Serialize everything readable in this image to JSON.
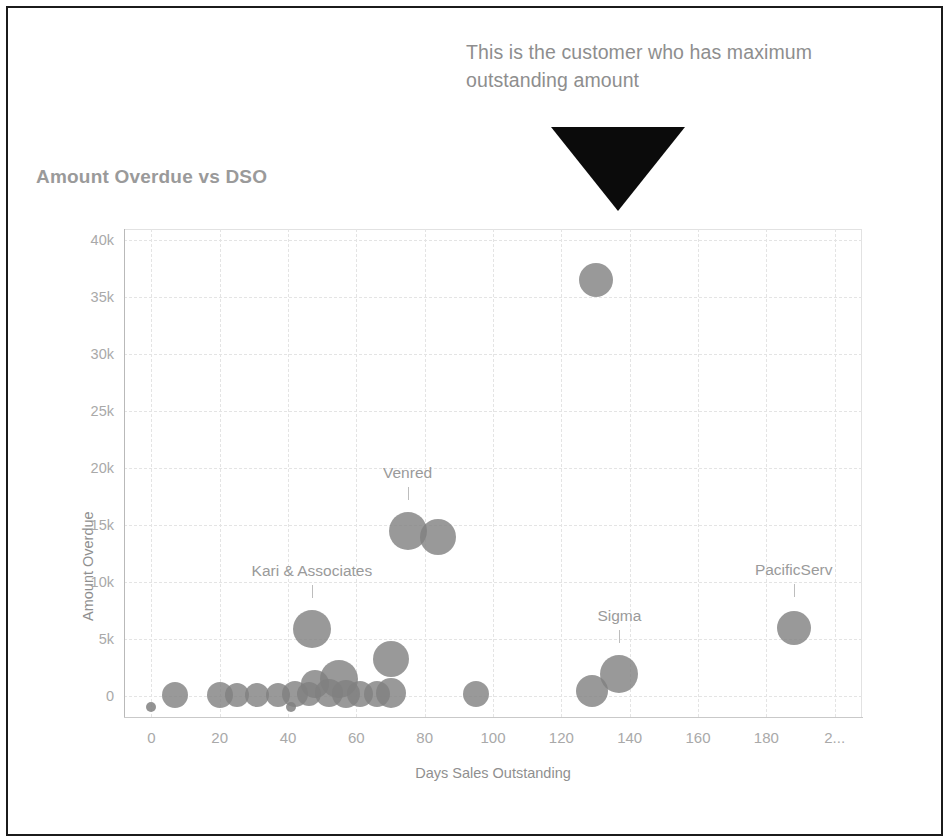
{
  "annotation": {
    "text": "This is the customer who has maximum outstanding amount",
    "arrow_icon": "down-triangle-arrow-icon",
    "color": "#8e8e8e"
  },
  "chart_title": "Amount Overdue vs DSO",
  "chart_data": {
    "type": "scatter",
    "title": "Amount Overdue vs DSO",
    "xlabel": "Days Sales Outstanding",
    "ylabel": "Amount Overdue",
    "xlim": [
      -8,
      208
    ],
    "ylim": [
      -1800,
      41000
    ],
    "grid": true,
    "legend": null,
    "xticks": [
      "0",
      "20",
      "40",
      "60",
      "80",
      "100",
      "120",
      "140",
      "160",
      "180",
      "2..."
    ],
    "xtick_values": [
      0,
      20,
      40,
      60,
      80,
      100,
      120,
      140,
      160,
      180,
      200
    ],
    "yticks": [
      "0",
      "5k",
      "10k",
      "15k",
      "20k",
      "25k",
      "30k",
      "35k",
      "40k"
    ],
    "ytick_values": [
      0,
      5000,
      10000,
      15000,
      20000,
      25000,
      30000,
      35000,
      40000
    ],
    "marker_color": "#808080",
    "points": [
      {
        "x": 130,
        "y": 36500,
        "r": 17,
        "label": null
      },
      {
        "x": 75,
        "y": 14500,
        "r": 19,
        "label": "Venred"
      },
      {
        "x": 84,
        "y": 14000,
        "r": 18,
        "label": null
      },
      {
        "x": 47,
        "y": 5900,
        "r": 19,
        "label": "Kari & Associates"
      },
      {
        "x": 188,
        "y": 6000,
        "r": 17,
        "label": "PacificServ"
      },
      {
        "x": 137,
        "y": 2000,
        "r": 19,
        "label": "Sigma"
      },
      {
        "x": 70,
        "y": 3300,
        "r": 18,
        "label": null
      },
      {
        "x": 55,
        "y": 1500,
        "r": 19,
        "label": null
      },
      {
        "x": 48,
        "y": 1100,
        "r": 14,
        "label": null
      },
      {
        "x": 129,
        "y": 500,
        "r": 16,
        "label": null
      },
      {
        "x": 7,
        "y": 150,
        "r": 13,
        "label": null
      },
      {
        "x": 20,
        "y": 150,
        "r": 13,
        "label": null
      },
      {
        "x": 25,
        "y": 150,
        "r": 12,
        "label": null
      },
      {
        "x": 31,
        "y": 150,
        "r": 12,
        "label": null
      },
      {
        "x": 37,
        "y": 150,
        "r": 12,
        "label": null
      },
      {
        "x": 42,
        "y": 250,
        "r": 13,
        "label": null
      },
      {
        "x": 46,
        "y": 200,
        "r": 12,
        "label": null
      },
      {
        "x": 52,
        "y": 300,
        "r": 14,
        "label": null
      },
      {
        "x": 57,
        "y": 250,
        "r": 14,
        "label": null
      },
      {
        "x": 61,
        "y": 200,
        "r": 13,
        "label": null
      },
      {
        "x": 66,
        "y": 250,
        "r": 13,
        "label": null
      },
      {
        "x": 70,
        "y": 300,
        "r": 15,
        "label": null
      },
      {
        "x": 95,
        "y": 200,
        "r": 13,
        "label": null
      }
    ],
    "below_axis_points": [
      {
        "x": 0,
        "y": -900,
        "r": 5
      },
      {
        "x": 41,
        "y": -900,
        "r": 5
      }
    ],
    "labeled_points": [
      {
        "name": "Venred",
        "x": 75,
        "y": 14500
      },
      {
        "name": "Kari & Associates",
        "x": 47,
        "y": 5900
      },
      {
        "name": "PacificServ",
        "x": 188,
        "y": 6000
      },
      {
        "name": "Sigma",
        "x": 137,
        "y": 2000
      }
    ]
  }
}
